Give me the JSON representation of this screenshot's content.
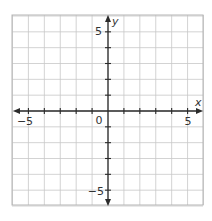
{
  "diagram": {
    "type": "coordinate-plane",
    "x_axis": {
      "label": "x",
      "min": -6,
      "max": 6,
      "tick_step": 1,
      "labeled_ticks": [
        {
          "value": -5,
          "text": "−5"
        },
        {
          "value": 5,
          "text": "5"
        }
      ]
    },
    "y_axis": {
      "label": "y",
      "min": -6,
      "max": 6,
      "tick_step": 1,
      "labeled_ticks": [
        {
          "value": 5,
          "text": "5"
        },
        {
          "value": -5,
          "text": "−5"
        }
      ]
    },
    "origin_label": "0",
    "grid": true,
    "colors": {
      "grid": "#c8c8c8",
      "border": "#b5b5b5",
      "axis": "#2b2b2b",
      "text": "#333333",
      "background": "#ffffff"
    }
  },
  "labels": {
    "x_axis_name": "x",
    "y_axis_name": "y",
    "origin": "0",
    "x_neg5": "−5",
    "x_pos5": "5",
    "y_pos5": "5",
    "y_neg5": "−5"
  }
}
